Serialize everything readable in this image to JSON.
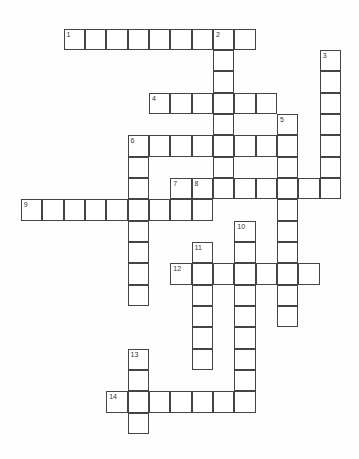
{
  "puzzle": {
    "type": "crossword",
    "clues_visible": false,
    "entries": [
      {
        "number": "1",
        "direction": "across",
        "row": 0,
        "col": 0,
        "length": 9
      },
      {
        "number": "2",
        "direction": "down",
        "row": 0,
        "col": 7,
        "length": 8
      },
      {
        "number": "3",
        "direction": "down",
        "row": 1,
        "col": 12,
        "length": 7
      },
      {
        "number": "4",
        "direction": "across",
        "row": 3,
        "col": 4,
        "length": 6
      },
      {
        "number": "5",
        "direction": "down",
        "row": 4,
        "col": 10,
        "length": 10
      },
      {
        "number": "6",
        "direction": "across",
        "row": 5,
        "col": 3,
        "length": 8
      },
      {
        "number": "6",
        "direction": "down",
        "row": 5,
        "col": 3,
        "length": 8
      },
      {
        "number": "7",
        "direction": "down",
        "row": 7,
        "col": 5,
        "length": 2
      },
      {
        "number": "8",
        "direction": "across",
        "row": 7,
        "col": 6,
        "length": 7
      },
      {
        "number": "8",
        "direction": "down",
        "row": 7,
        "col": 6,
        "length": 2
      },
      {
        "number": "9",
        "direction": "across",
        "row": 8,
        "col": -2,
        "length": 7
      },
      {
        "number": "10",
        "direction": "down",
        "row": 9,
        "col": 8,
        "length": 9
      },
      {
        "number": "11",
        "direction": "down",
        "row": 10,
        "col": 6,
        "length": 6
      },
      {
        "number": "12",
        "direction": "across",
        "row": 11,
        "col": 5,
        "length": 7
      },
      {
        "number": "13",
        "direction": "down",
        "row": 15,
        "col": 3,
        "length": 4
      },
      {
        "number": "14",
        "direction": "across",
        "row": 17,
        "col": 2,
        "length": 7
      }
    ]
  }
}
